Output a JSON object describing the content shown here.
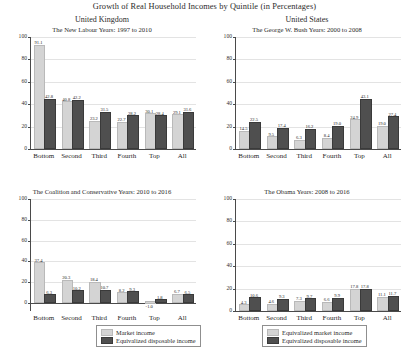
{
  "header": {
    "main_title": "Growth of Real Household Incomes by Quintile (in Percentages)",
    "country_left": "United Kingdom",
    "country_right": "United States"
  },
  "axis": {
    "ticks": [
      "0",
      "20",
      "40",
      "60",
      "80",
      "100"
    ],
    "categories": [
      "Bottom",
      "Second",
      "Third",
      "Fourth",
      "Top",
      "All"
    ]
  },
  "colors": {
    "light_bar": "#d4d4d4",
    "dark_bar": "#4f4f4f",
    "gridline": "#e3e3e3",
    "axis": "#4a4a4a"
  },
  "legend_left": {
    "items": [
      {
        "label": "Market income",
        "color": "#d4d4d4"
      },
      {
        "label": "Equivalized disposable income",
        "color": "#4f4f4f"
      }
    ]
  },
  "legend_right": {
    "items": [
      {
        "label": "Equivalized market income",
        "color": "#d4d4d4"
      },
      {
        "label": "Equivalized disposable income",
        "color": "#4f4f4f"
      }
    ]
  },
  "panels": {
    "top_left": {
      "subtitle": "The New Labour Years: 1997 to 2010"
    },
    "top_right": {
      "subtitle": "The George W. Bush Years: 2000 to 2008"
    },
    "bottom_left": {
      "subtitle": "The Coalition and Conservative Years: 2010 to 2016"
    },
    "bottom_right": {
      "subtitle": "The Obama Years: 2008 to 2016"
    }
  },
  "chart_data": [
    {
      "type": "bar",
      "id": "top_left",
      "title": "The New Labour Years: 1997 to 2010",
      "panel_title": "United Kingdom",
      "categories": [
        "Bottom",
        "Second",
        "Third",
        "Fourth",
        "Top",
        "All"
      ],
      "series": [
        {
          "name": "Market income",
          "color": "#d4d4d4",
          "values": [
            91.1,
            40.8,
            23.2,
            22.7,
            30.1,
            29.1
          ]
        },
        {
          "name": "Equivalized disposable income",
          "color": "#4f4f4f",
          "values": [
            42.8,
            42.2,
            31.5,
            28.2,
            28.4,
            31.6
          ]
        }
      ],
      "xlabel": "",
      "ylabel": "",
      "ylim": [
        0,
        100
      ],
      "yticks": [
        0,
        20,
        40,
        60,
        80,
        100
      ],
      "grid": true,
      "legend_position": "below-figure"
    },
    {
      "type": "bar",
      "id": "top_right",
      "title": "The George W. Bush Years: 2000 to 2008",
      "panel_title": "United States",
      "categories": [
        "Bottom",
        "Second",
        "Third",
        "Fourth",
        "Top",
        "All"
      ],
      "series": [
        {
          "name": "Equivalized market income",
          "color": "#d4d4d4",
          "values": [
            14.5,
            9.5,
            6.3,
            8.4,
            24.9,
            19.0
          ]
        },
        {
          "name": "Equivalized disposable income",
          "color": "#4f4f4f",
          "values": [
            22.5,
            17.4,
            16.2,
            19.0,
            43.1,
            27.4
          ]
        }
      ],
      "xlabel": "",
      "ylabel": "",
      "ylim": [
        0,
        100
      ],
      "yticks": [
        0,
        20,
        40,
        60,
        80,
        100
      ],
      "grid": true,
      "legend_position": "below-figure"
    },
    {
      "type": "bar",
      "id": "bottom_left",
      "title": "The Coalition and Conservative Years: 2010 to 2016",
      "panel_title": "United Kingdom",
      "categories": [
        "Bottom",
        "Second",
        "Third",
        "Fourth",
        "Top",
        "All"
      ],
      "series": [
        {
          "name": "Market income",
          "color": "#d4d4d4",
          "values": [
            37.4,
            20.3,
            18.4,
            8.2,
            -1.0,
            6.7
          ]
        },
        {
          "name": "Equivalized disposable income",
          "color": "#4f4f4f",
          "values": [
            6.3,
            10.2,
            10.7,
            9.3,
            1.8,
            6.5
          ]
        }
      ],
      "xlabel": "",
      "ylabel": "",
      "ylim": [
        0,
        100
      ],
      "yticks": [
        0,
        20,
        40,
        60,
        80,
        100
      ],
      "grid": true,
      "legend_position": "below-figure"
    },
    {
      "type": "bar",
      "id": "bottom_right",
      "title": "The Obama Years: 2008 to 2016",
      "panel_title": "United States",
      "categories": [
        "Bottom",
        "Second",
        "Third",
        "Fourth",
        "Top",
        "All"
      ],
      "series": [
        {
          "name": "Equivalized market income",
          "color": "#d4d4d4",
          "values": [
            4.3,
            4.6,
            7.3,
            6.6,
            17.8,
            11.1
          ]
        },
        {
          "name": "Equivalized disposable income",
          "color": "#4f4f4f",
          "values": [
            10.6,
            9.3,
            9.7,
            9.9,
            17.8,
            11.7
          ]
        }
      ],
      "xlabel": "",
      "ylabel": "",
      "ylim": [
        0,
        100
      ],
      "yticks": [
        0,
        20,
        40,
        60,
        80,
        100
      ],
      "grid": true,
      "legend_position": "below-figure"
    }
  ]
}
